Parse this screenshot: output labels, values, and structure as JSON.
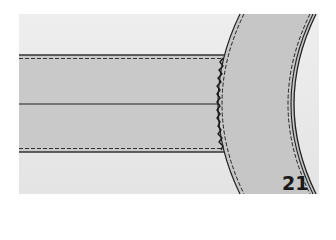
{
  "figure": {
    "label": "21",
    "colors": {
      "background": "#ffffff",
      "panel": "#e9e9e9",
      "band": "#c8c8c8",
      "line": "#222222"
    }
  }
}
